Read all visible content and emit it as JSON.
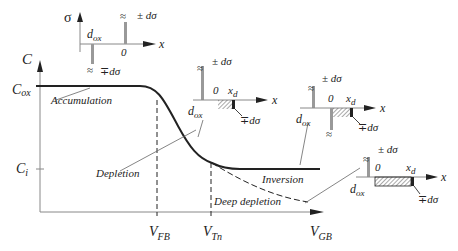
{
  "axes": {
    "y_label": "C",
    "x_label": "V",
    "x_label_sub": "GB",
    "y_ticks": [
      {
        "main": "C",
        "sub": "ox"
      },
      {
        "main": "C",
        "sub": "i"
      }
    ],
    "x_ticks": [
      {
        "main": "V",
        "sub": "FB"
      },
      {
        "main": "V",
        "sub": "Tn"
      }
    ]
  },
  "regions": {
    "accumulation": "Accumulation",
    "depletion": "Depletion",
    "inversion": "Inversion",
    "deep_depletion": "Deep depletion"
  },
  "inset": {
    "sigma": "σ",
    "x": "x",
    "dox": "d",
    "dox_sub": "ox",
    "zero": "0",
    "xd": "x",
    "xd_sub": "d",
    "plus_minus": "± dσ",
    "minus_plus": "∓dσ"
  }
}
